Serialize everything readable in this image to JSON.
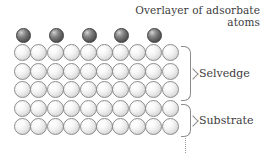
{
  "figure": {
    "caption": {
      "line1": "Overlayer of adsorbate",
      "line2": "atoms"
    },
    "labels": {
      "selvedge": "Selvedge",
      "substrate": "Substrate"
    },
    "lattice": {
      "columns": 10,
      "substrate_rows": 5,
      "selvedge_rows": 3,
      "bulk_rows": 2,
      "adsorbate_count": 5,
      "adsorbate_columns": [
        0,
        2,
        4,
        6,
        8
      ]
    },
    "colors": {
      "adsorbate_atom": "#5e5e5e",
      "substrate_atom": "#e8e8e8",
      "atom_outline": "#8d8d8d",
      "brace": "#8c8c8c",
      "text": "#3d3d3d",
      "background": "#ffffff"
    }
  }
}
